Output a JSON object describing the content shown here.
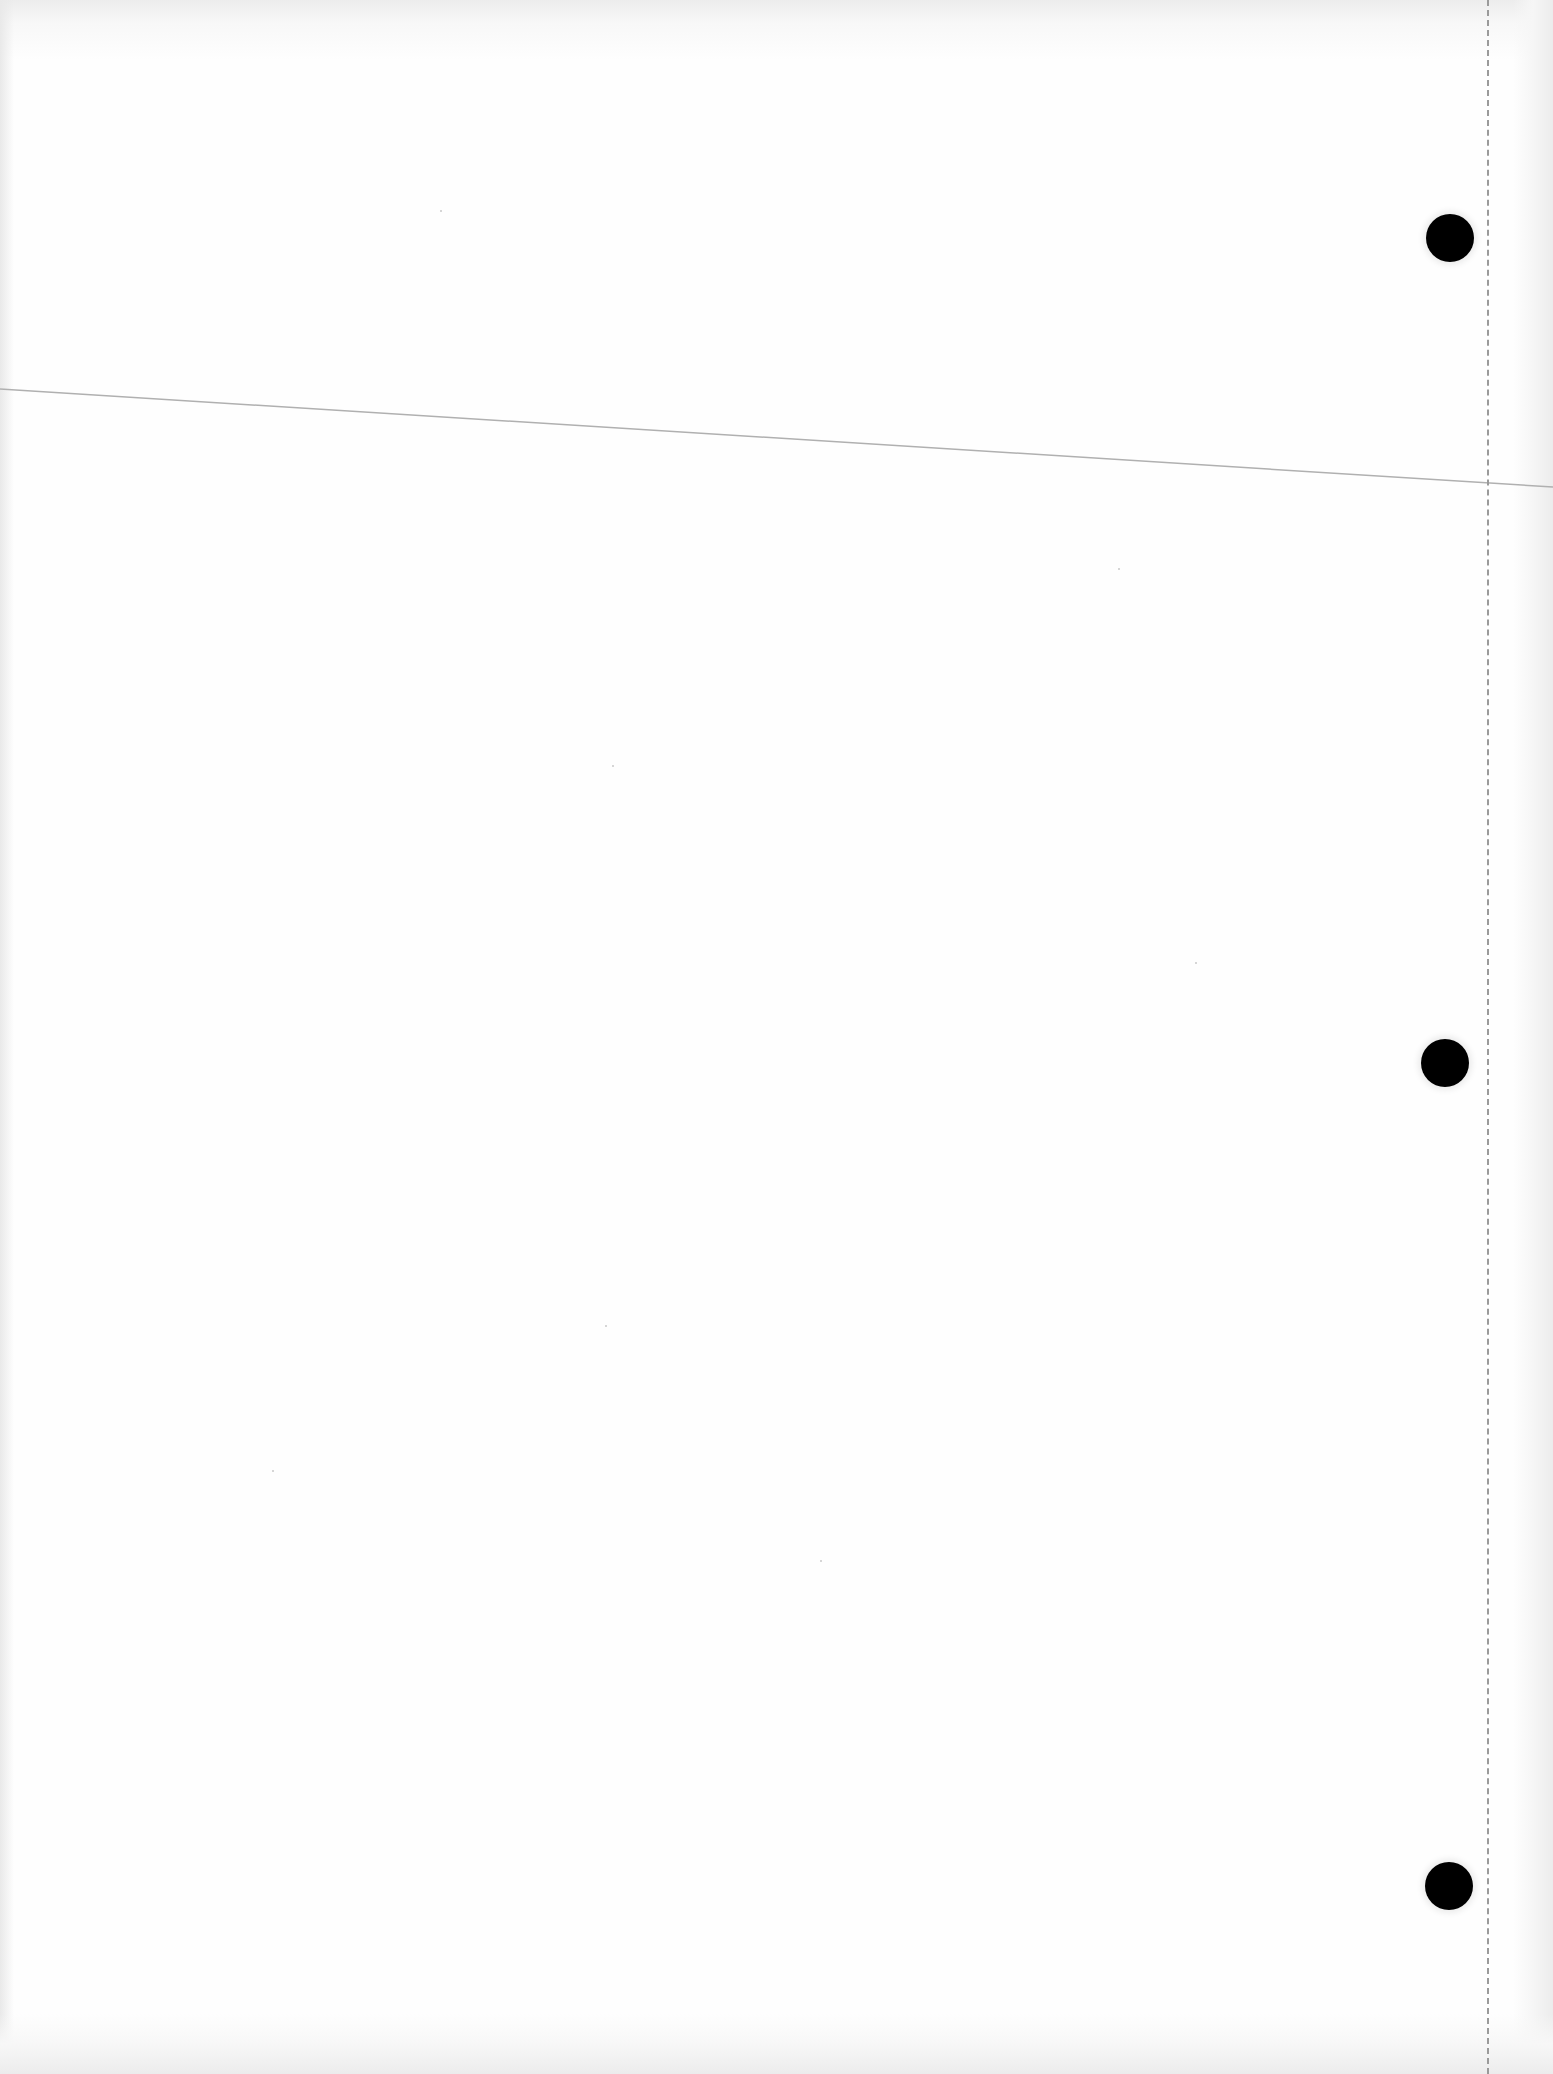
{
  "document": {
    "type": "blank scanned page",
    "text_content": "",
    "background_color": "#fefefe",
    "features": {
      "punch_holes": [
        {
          "x": 1450,
          "y": 238,
          "diameter": 48
        },
        {
          "x": 1445,
          "y": 1063,
          "diameter": 48
        },
        {
          "x": 1449,
          "y": 1886,
          "diameter": 48
        }
      ],
      "punch_hole_color": "#000000",
      "perforation_line": {
        "x": 1488,
        "style": "dashed",
        "color": "#9a9a9a"
      },
      "crease_line": {
        "from": [
          0,
          389
        ],
        "to": [
          1553,
          487
        ],
        "color": "#b0b0b0"
      }
    }
  }
}
